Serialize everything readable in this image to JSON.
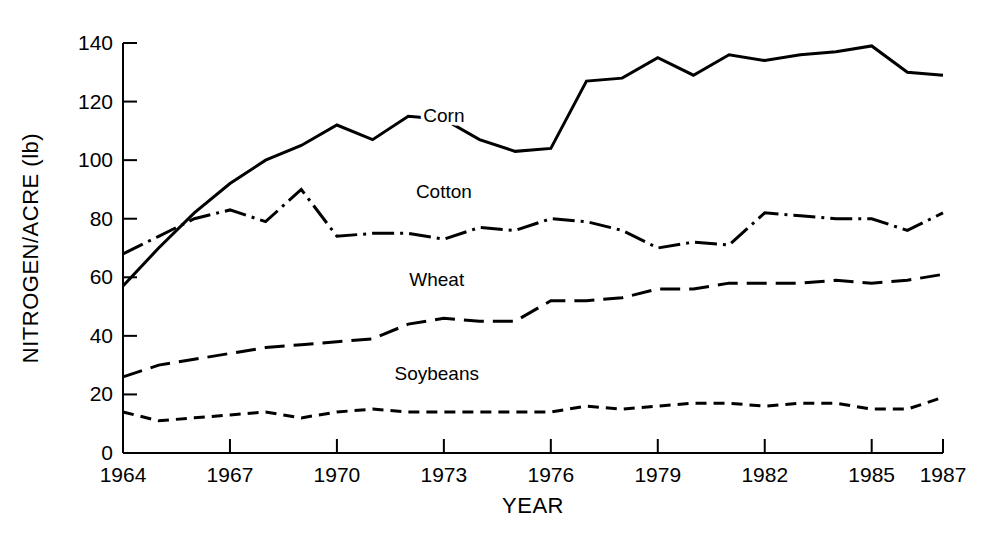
{
  "chart_data": {
    "type": "line",
    "title": "",
    "xlabel": "YEAR",
    "ylabel": "NITROGEN/ACRE (lb)",
    "xlim": [
      1964,
      1987
    ],
    "ylim": [
      0,
      140
    ],
    "grid": false,
    "legend_position": "inline-labels",
    "x": [
      1964,
      1965,
      1966,
      1967,
      1968,
      1969,
      1970,
      1971,
      1972,
      1973,
      1974,
      1975,
      1976,
      1977,
      1978,
      1979,
      1980,
      1981,
      1982,
      1983,
      1984,
      1985,
      1986,
      1987
    ],
    "xticks": [
      1964,
      1967,
      1970,
      1973,
      1976,
      1979,
      1982,
      1985,
      1987
    ],
    "xtick_labels": [
      "1964",
      "1967",
      "1970",
      "1973",
      "1976",
      "1979",
      "1982",
      "1985",
      "1987"
    ],
    "yticks": [
      0,
      20,
      40,
      60,
      80,
      100,
      120,
      140
    ],
    "ytick_labels": [
      "0",
      "20",
      "40",
      "60",
      "80",
      "100",
      "120",
      "140"
    ],
    "series": [
      {
        "name": "Corn",
        "label": "Corn",
        "line_style": "solid",
        "color": "#000000",
        "label_x": 1973.0,
        "label_y": 113,
        "values": [
          57,
          70,
          82,
          92,
          100,
          105,
          112,
          107,
          115,
          114,
          107,
          103,
          104,
          127,
          128,
          135,
          129,
          136,
          134,
          136,
          137,
          139,
          130,
          129
        ]
      },
      {
        "name": "Cotton",
        "label": "Cotton",
        "line_style": "dash-dot",
        "color": "#000000",
        "label_x": 1973.0,
        "label_y": 87,
        "values": [
          68,
          74,
          80,
          83,
          79,
          90,
          74,
          75,
          75,
          73,
          77,
          76,
          80,
          79,
          76,
          70,
          72,
          71,
          82,
          81,
          80,
          80,
          76,
          82
        ]
      },
      {
        "name": "Wheat",
        "label": "Wheat",
        "line_style": "long-dash",
        "color": "#000000",
        "label_x": 1972.8,
        "label_y": 57,
        "values": [
          26,
          30,
          32,
          34,
          36,
          37,
          38,
          39,
          44,
          46,
          45,
          45,
          52,
          52,
          53,
          56,
          56,
          58,
          58,
          58,
          59,
          58,
          59,
          61
        ]
      },
      {
        "name": "Soybeans",
        "label": "Soybeans",
        "line_style": "short-dash",
        "color": "#000000",
        "label_x": 1972.8,
        "label_y": 25,
        "values": [
          14,
          11,
          12,
          13,
          14,
          12,
          14,
          15,
          14,
          14,
          14,
          14,
          14,
          16,
          15,
          16,
          17,
          17,
          16,
          17,
          17,
          15,
          15,
          19
        ]
      }
    ]
  },
  "axis": {
    "y_title": "NITROGEN/ACRE (lb)",
    "x_title": "YEAR"
  }
}
